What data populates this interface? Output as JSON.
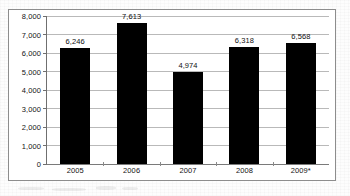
{
  "chart_data": {
    "type": "bar",
    "title": "",
    "subtitle": "",
    "xlabel": "",
    "ylabel": "",
    "categories": [
      "2005",
      "2006",
      "2007",
      "2008",
      "2009*"
    ],
    "values": [
      6246,
      7613,
      4974,
      6318,
      6568
    ],
    "data_labels": [
      "6,246",
      "7,613",
      "4,974",
      "6,318",
      "6,568"
    ],
    "ylim": [
      0,
      8000
    ],
    "ytick_values": [
      0,
      1000,
      2000,
      3000,
      4000,
      5000,
      6000,
      7000,
      8000
    ],
    "ytick_labels": [
      "0",
      "1,000",
      "2,000",
      "3,000",
      "4,000",
      "5,000",
      "6,000",
      "7,000",
      "8,000"
    ],
    "grid": true,
    "legend": false,
    "legend_position": "none",
    "series": [
      {
        "name": "",
        "values": [
          6246,
          7613,
          4974,
          6318,
          6568
        ]
      }
    ],
    "colors": {
      "bar": "#000000",
      "gridline": "#b9b9b9",
      "axis": "#6f6f6f",
      "frame": "#8d8d8d",
      "text": "#141414",
      "background": "#ffffff"
    }
  }
}
